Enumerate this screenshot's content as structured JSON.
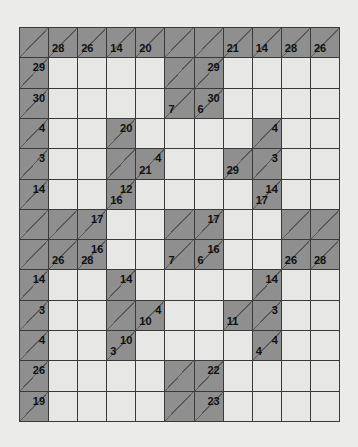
{
  "puzzle": {
    "type": "kakuro",
    "rows": 13,
    "cols": 11,
    "colors": {
      "background": "#ebebe9",
      "clue_cell": "#8f8f8f",
      "white_cell": "#e7e7e5",
      "grid_line": "#3a3a3a",
      "diagonal": "#5a5a5a",
      "text": "#111111"
    },
    "grid": [
      [
        {
          "t": "c"
        },
        {
          "t": "c",
          "d": "28"
        },
        {
          "t": "c",
          "d": "26"
        },
        {
          "t": "c",
          "d": "14"
        },
        {
          "t": "c",
          "d": "20"
        },
        {
          "t": "c"
        },
        {
          "t": "c"
        },
        {
          "t": "c",
          "d": "21"
        },
        {
          "t": "c",
          "d": "14"
        },
        {
          "t": "c",
          "d": "28"
        },
        {
          "t": "c",
          "d": "26"
        }
      ],
      [
        {
          "t": "c",
          "a": "29"
        },
        {
          "t": "w"
        },
        {
          "t": "w"
        },
        {
          "t": "w"
        },
        {
          "t": "w"
        },
        {
          "t": "c"
        },
        {
          "t": "c",
          "a": "29"
        },
        {
          "t": "w"
        },
        {
          "t": "w"
        },
        {
          "t": "w"
        },
        {
          "t": "w"
        }
      ],
      [
        {
          "t": "c",
          "a": "30"
        },
        {
          "t": "w"
        },
        {
          "t": "w"
        },
        {
          "t": "w"
        },
        {
          "t": "w"
        },
        {
          "t": "c",
          "d": "7"
        },
        {
          "t": "c",
          "d": "6",
          "a": "30"
        },
        {
          "t": "w"
        },
        {
          "t": "w"
        },
        {
          "t": "w"
        },
        {
          "t": "w"
        }
      ],
      [
        {
          "t": "c",
          "a": "4"
        },
        {
          "t": "w"
        },
        {
          "t": "w"
        },
        {
          "t": "c",
          "a": "20"
        },
        {
          "t": "w"
        },
        {
          "t": "w"
        },
        {
          "t": "w"
        },
        {
          "t": "w"
        },
        {
          "t": "c",
          "a": "4"
        },
        {
          "t": "w"
        },
        {
          "t": "w"
        }
      ],
      [
        {
          "t": "c",
          "a": "3"
        },
        {
          "t": "w"
        },
        {
          "t": "w"
        },
        {
          "t": "c"
        },
        {
          "t": "c",
          "d": "21",
          "a": "4"
        },
        {
          "t": "w"
        },
        {
          "t": "w"
        },
        {
          "t": "c",
          "d": "29"
        },
        {
          "t": "c",
          "a": "3"
        },
        {
          "t": "w"
        },
        {
          "t": "w"
        }
      ],
      [
        {
          "t": "c",
          "a": "14"
        },
        {
          "t": "w"
        },
        {
          "t": "w"
        },
        {
          "t": "c",
          "d": "16",
          "a": "12"
        },
        {
          "t": "w"
        },
        {
          "t": "w"
        },
        {
          "t": "w"
        },
        {
          "t": "w"
        },
        {
          "t": "c",
          "d": "17",
          "a": "14"
        },
        {
          "t": "w"
        },
        {
          "t": "w"
        }
      ],
      [
        {
          "t": "c"
        },
        {
          "t": "c"
        },
        {
          "t": "c",
          "a": "17"
        },
        {
          "t": "w"
        },
        {
          "t": "w"
        },
        {
          "t": "c"
        },
        {
          "t": "c",
          "a": "17"
        },
        {
          "t": "w"
        },
        {
          "t": "w"
        },
        {
          "t": "c"
        },
        {
          "t": "c"
        }
      ],
      [
        {
          "t": "c"
        },
        {
          "t": "c",
          "d": "26"
        },
        {
          "t": "c",
          "d": "28",
          "a": "16"
        },
        {
          "t": "w"
        },
        {
          "t": "w"
        },
        {
          "t": "c",
          "d": "7"
        },
        {
          "t": "c",
          "d": "6",
          "a": "16"
        },
        {
          "t": "w"
        },
        {
          "t": "w"
        },
        {
          "t": "c",
          "d": "26"
        },
        {
          "t": "c",
          "d": "28"
        }
      ],
      [
        {
          "t": "c",
          "a": "14"
        },
        {
          "t": "w"
        },
        {
          "t": "w"
        },
        {
          "t": "c",
          "a": "14"
        },
        {
          "t": "w"
        },
        {
          "t": "w"
        },
        {
          "t": "w"
        },
        {
          "t": "w"
        },
        {
          "t": "c",
          "a": "14"
        },
        {
          "t": "w"
        },
        {
          "t": "w"
        }
      ],
      [
        {
          "t": "c",
          "a": "3"
        },
        {
          "t": "w"
        },
        {
          "t": "w"
        },
        {
          "t": "c"
        },
        {
          "t": "c",
          "d": "10",
          "a": "4"
        },
        {
          "t": "w"
        },
        {
          "t": "w"
        },
        {
          "t": "c",
          "d": "11"
        },
        {
          "t": "c",
          "a": "3"
        },
        {
          "t": "w"
        },
        {
          "t": "w"
        }
      ],
      [
        {
          "t": "c",
          "a": "4"
        },
        {
          "t": "w"
        },
        {
          "t": "w"
        },
        {
          "t": "c",
          "d": "3",
          "a": "10"
        },
        {
          "t": "w"
        },
        {
          "t": "w"
        },
        {
          "t": "w"
        },
        {
          "t": "w"
        },
        {
          "t": "c",
          "d": "4",
          "a": "4"
        },
        {
          "t": "w"
        },
        {
          "t": "w"
        }
      ],
      [
        {
          "t": "c",
          "a": "26"
        },
        {
          "t": "w"
        },
        {
          "t": "w"
        },
        {
          "t": "w"
        },
        {
          "t": "w"
        },
        {
          "t": "c"
        },
        {
          "t": "c",
          "a": "22"
        },
        {
          "t": "w"
        },
        {
          "t": "w"
        },
        {
          "t": "w"
        },
        {
          "t": "w"
        }
      ],
      [
        {
          "t": "c",
          "a": "19"
        },
        {
          "t": "w"
        },
        {
          "t": "w"
        },
        {
          "t": "w"
        },
        {
          "t": "w"
        },
        {
          "t": "c"
        },
        {
          "t": "c",
          "a": "23"
        },
        {
          "t": "w"
        },
        {
          "t": "w"
        },
        {
          "t": "w"
        },
        {
          "t": "w"
        }
      ]
    ]
  }
}
